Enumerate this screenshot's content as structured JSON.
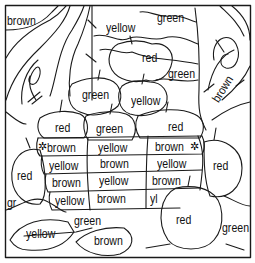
{
  "page": {
    "type": "color-by-word coloring page"
  },
  "labels": [
    {
      "id": "tree-left",
      "text": "brown",
      "x": 7,
      "y": 15
    },
    {
      "id": "leaves-top",
      "text": "yellow",
      "x": 106,
      "y": 22
    },
    {
      "id": "leaves-top-right",
      "text": "green",
      "x": 157,
      "y": 12
    },
    {
      "id": "apple-top",
      "text": "red",
      "x": 142,
      "y": 52
    },
    {
      "id": "leaves-right",
      "text": "green",
      "x": 168,
      "y": 68
    },
    {
      "id": "tree-right",
      "text": "brown",
      "x": 210,
      "y": 90
    },
    {
      "id": "apple-green",
      "text": "green",
      "x": 82,
      "y": 89
    },
    {
      "id": "apple-yellow",
      "text": "yellow",
      "x": 131,
      "y": 95
    },
    {
      "id": "apple-row-left",
      "text": "red",
      "x": 55,
      "y": 122
    },
    {
      "id": "apple-row-mid",
      "text": "green",
      "x": 96,
      "y": 123
    },
    {
      "id": "apple-row-right",
      "text": "red",
      "x": 168,
      "y": 121
    },
    {
      "id": "basket-r1c1",
      "text": "brown",
      "x": 47,
      "y": 145
    },
    {
      "id": "basket-r1c2",
      "text": "yellow",
      "x": 98,
      "y": 145
    },
    {
      "id": "basket-r1c3",
      "text": "brown",
      "x": 155,
      "y": 143
    },
    {
      "id": "basket-r2c1",
      "text": "yellow",
      "x": 49,
      "y": 162
    },
    {
      "id": "basket-r2c2",
      "text": "brown",
      "x": 100,
      "y": 160
    },
    {
      "id": "basket-r2c3",
      "text": "yellow",
      "x": 157,
      "y": 160
    },
    {
      "id": "basket-r3c1",
      "text": "brown",
      "x": 52,
      "y": 179
    },
    {
      "id": "basket-r3c2",
      "text": "yellow",
      "x": 99,
      "y": 177
    },
    {
      "id": "basket-r3c3",
      "text": "brown",
      "x": 152,
      "y": 177
    },
    {
      "id": "basket-r4c1",
      "text": "yellow",
      "x": 55,
      "y": 197
    },
    {
      "id": "basket-r4c2",
      "text": "brown",
      "x": 97,
      "y": 195
    },
    {
      "id": "basket-r4c3",
      "text": "yl",
      "x": 150,
      "y": 195
    },
    {
      "id": "apple-left",
      "text": "red",
      "x": 17,
      "y": 170
    },
    {
      "id": "apple-right",
      "text": "red",
      "x": 213,
      "y": 160
    },
    {
      "id": "grass-left",
      "text": "gr",
      "x": 7,
      "y": 197
    },
    {
      "id": "leaf-stem",
      "text": "green",
      "x": 74,
      "y": 215
    },
    {
      "id": "leaf-left",
      "text": "yellow",
      "x": 26,
      "y": 228
    },
    {
      "id": "leaf-right",
      "text": "brown",
      "x": 94,
      "y": 235
    },
    {
      "id": "apple-bottom",
      "text": "red",
      "x": 176,
      "y": 214
    },
    {
      "id": "grass-right",
      "text": "green",
      "x": 222,
      "y": 222
    }
  ],
  "colors": {
    "line": "#1a1a1a",
    "background": "#ffffff"
  }
}
